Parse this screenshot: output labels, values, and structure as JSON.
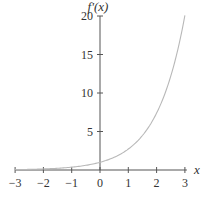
{
  "chart_data": {
    "type": "line",
    "title": "",
    "xlabel": "x",
    "ylabel": "f'(x)",
    "xlim": [
      -3,
      3
    ],
    "ylim": [
      0,
      20
    ],
    "grid": false,
    "legend": null,
    "x_ticks": [
      -3,
      -2,
      -1,
      0,
      1,
      2,
      3
    ],
    "x_tick_labels": [
      "−3",
      "−2",
      "−1",
      "0",
      "1",
      "2",
      "3"
    ],
    "y_ticks": [
      5,
      10,
      15,
      20
    ],
    "y_tick_labels": [
      "5",
      "10",
      "15",
      "20"
    ],
    "series": [
      {
        "name": "f'(x)",
        "function": "e^x",
        "x": [
          -3,
          -2.5,
          -2,
          -1.5,
          -1,
          -0.5,
          0,
          0.5,
          1,
          1.5,
          2,
          2.5,
          3
        ],
        "values": [
          0.05,
          0.08,
          0.14,
          0.22,
          0.37,
          0.61,
          1.0,
          1.65,
          2.72,
          4.48,
          7.39,
          12.18,
          20.09
        ],
        "color": "#b8b8b8"
      }
    ]
  },
  "colors": {
    "axis": "#555555",
    "curve": "#b8b8b8",
    "text": "#333333"
  }
}
